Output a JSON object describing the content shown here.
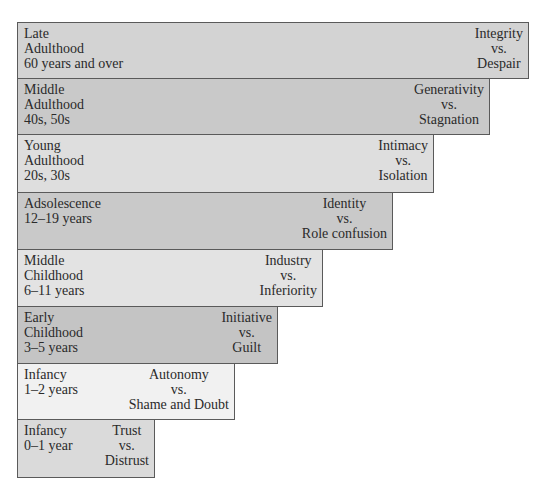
{
  "diagram": {
    "stages": [
      {
        "age_lines": [
          "Late",
          "Adulthood",
          "60 years and over"
        ],
        "crisis": {
          "positive": "Integrity",
          "vs": "vs.",
          "negative": "Despair"
        },
        "fill": "#d3d3d3",
        "top": 22,
        "height": 57,
        "width": 512
      },
      {
        "age_lines": [
          "Middle",
          "Adulthood",
          "40s, 50s"
        ],
        "crisis": {
          "positive": "Generativity",
          "vs": "vs.",
          "negative": "Stagnation"
        },
        "fill": "#c9c9c9",
        "top": 79,
        "height": 56,
        "width": 473
      },
      {
        "age_lines": [
          "Young",
          "Adulthood",
          "20s, 30s"
        ],
        "crisis": {
          "positive": "Intimacy",
          "vs": "vs.",
          "negative": "Isolation"
        },
        "fill": "#dedede",
        "top": 135,
        "height": 58,
        "width": 417
      },
      {
        "age_lines": [
          "Adsolescence",
          "12–19 years"
        ],
        "crisis": {
          "positive": "Identity",
          "vs": "vs.",
          "negative": "Role confusion"
        },
        "fill": "#c9c9c9",
        "top": 193,
        "height": 57,
        "width": 376
      },
      {
        "age_lines": [
          "Middle",
          "Childhood",
          "6–11 years"
        ],
        "crisis": {
          "positive": "Industry",
          "vs": "vs.",
          "negative": "Inferiority"
        },
        "fill": "#e3e3e3",
        "top": 250,
        "height": 57,
        "width": 306
      },
      {
        "age_lines": [
          "Early",
          "Childhood",
          "3–5 years"
        ],
        "crisis": {
          "positive": "Initiative",
          "vs": "vs.",
          "negative": "Guilt"
        },
        "fill": "#c4c4c4",
        "top": 307,
        "height": 57,
        "width": 261
      },
      {
        "age_lines": [
          "Infancy",
          "1–2 years"
        ],
        "crisis": {
          "positive": "Autonomy",
          "vs": "vs.",
          "negative": "Shame and Doubt"
        },
        "fill": "#f1f1f1",
        "top": 364,
        "height": 56,
        "width": 218
      },
      {
        "age_lines": [
          "Infancy",
          "0–1 year"
        ],
        "crisis": {
          "positive": "Trust",
          "vs": "vs.",
          "negative": "Distrust"
        },
        "fill": "#dadada",
        "top": 420,
        "height": 58,
        "width": 138
      }
    ],
    "border_color": "#5a5a5a"
  }
}
